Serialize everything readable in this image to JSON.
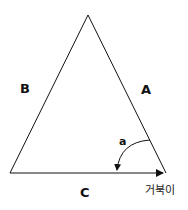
{
  "diagram": {
    "side_labels": {
      "A": "A",
      "B": "B",
      "C": "C"
    },
    "angle_label": "a",
    "turtle_label": "거북이",
    "stroke_color": "#111111"
  }
}
